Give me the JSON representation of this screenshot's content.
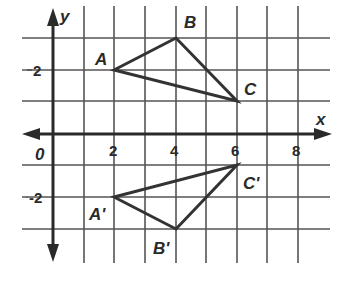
{
  "diagram": {
    "type": "coordinate-plane-reflection",
    "axes": {
      "x_label": "x",
      "y_label": "y",
      "origin_label": "0",
      "x_ticks": [
        "2",
        "4",
        "6",
        "8"
      ],
      "y_ticks": [
        "2",
        "-2"
      ]
    },
    "triangle_original": {
      "vertices": [
        {
          "label": "A",
          "x": 2,
          "y": 2
        },
        {
          "label": "B",
          "x": 4,
          "y": 3
        },
        {
          "label": "C",
          "x": 6,
          "y": 1
        }
      ]
    },
    "triangle_image": {
      "vertices": [
        {
          "label": "A'",
          "x": 2,
          "y": -2
        },
        {
          "label": "B'",
          "x": 4,
          "y": -3
        },
        {
          "label": "C'",
          "x": 6,
          "y": -1
        }
      ]
    },
    "colors": {
      "grid": "#555555",
      "axis": "#2a2a2a",
      "triangle": "#333333",
      "background": "#ffffff"
    }
  }
}
